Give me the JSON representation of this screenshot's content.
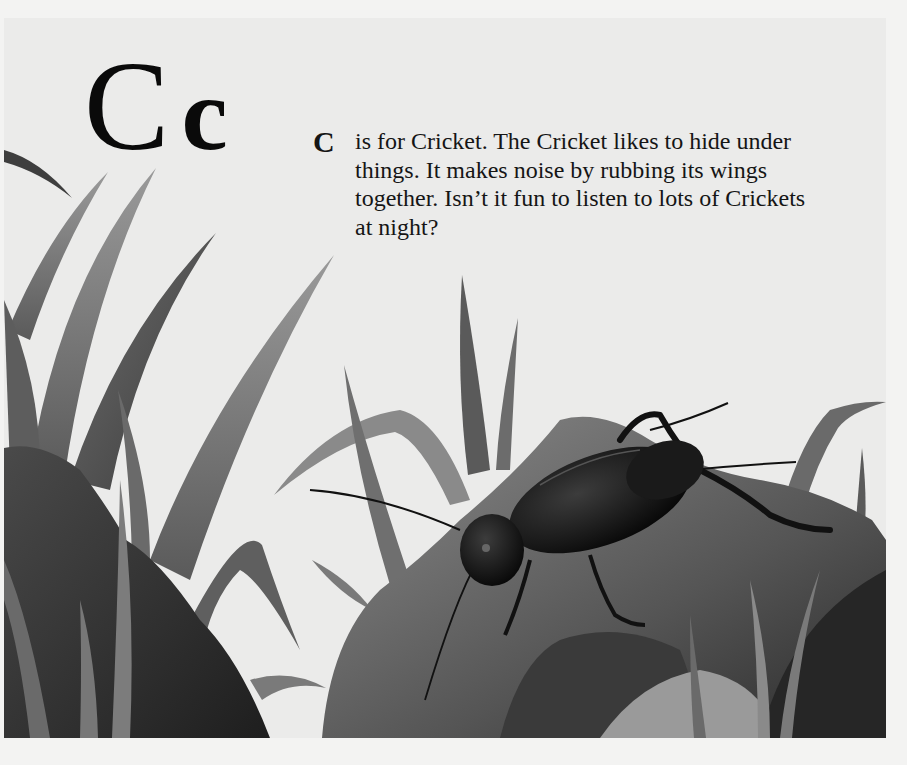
{
  "page": {
    "heading": {
      "uppercase": "C",
      "lowercase": "c"
    },
    "verse": {
      "initial": "C",
      "lines": [
        "is for Cricket. The Cricket likes to hide under",
        "things. It makes noise by rubbing its wings",
        "together. Isn’t it fun to listen to lots of Crickets",
        "at night?"
      ]
    },
    "illustration": {
      "subject": "cricket on a rock among grass blades",
      "style": "grayscale painting",
      "colors": {
        "paper": "#f3f3f2",
        "background": "#ebebea",
        "grass_light": "#8a8a8a",
        "grass_dark": "#4e4e4e",
        "rock_light": "#7d7d7d",
        "rock_dark": "#2e2e2e",
        "cricket": "#111111"
      }
    }
  }
}
